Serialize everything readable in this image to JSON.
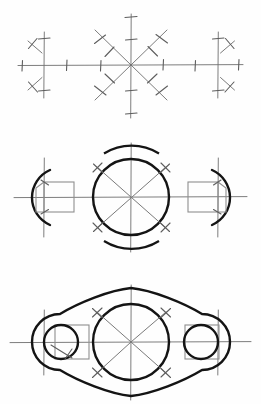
{
  "document": {
    "title": "Geometric Construction — Three Stages",
    "background_color": "#fefefe",
    "width": 261,
    "height": 404,
    "line_colors": {
      "construction": "#6e6e6e",
      "light_gray": "#8e8e8e",
      "object_outline": "#141414"
    }
  },
  "figures": [
    {
      "id": "stage-1",
      "caption": "Stage 1 — centerlines and compass step-off marks",
      "center_axis_y": 65,
      "horizontal_axis": {
        "x1": 18,
        "x2": 243,
        "y": 65
      },
      "centers": [
        {
          "name": "left-center",
          "x": 44,
          "y": 65,
          "vertical_extent": [
            32,
            98
          ]
        },
        {
          "name": "middle-center",
          "x": 131,
          "y": 65,
          "vertical_extent": [
            14,
            118
          ]
        },
        {
          "name": "right-center",
          "x": 218,
          "y": 65,
          "vertical_extent": [
            32,
            98
          ]
        }
      ],
      "star_rays": 8,
      "ray_tick_count_per_ray": 2,
      "side_diagonal_marks": 2
    },
    {
      "id": "stage-2",
      "caption": "Stage 2 — circles, arcs and squares blocked in",
      "center_axis_y": 197,
      "horizontal_axis": {
        "x1": 14,
        "x2": 247,
        "y": 197
      },
      "middle_circle": {
        "cx": 131,
        "cy": 197,
        "r": 38
      },
      "middle_arcs": {
        "radius": 52,
        "top": true,
        "bottom": true
      },
      "left_detail": {
        "cx": 44,
        "cy": 197,
        "arc_radius": 30,
        "square_size": 30,
        "opens": "left"
      },
      "right_detail": {
        "cx": 218,
        "cy": 197,
        "arc_radius": 30,
        "square_size": 30,
        "opens": "right"
      }
    },
    {
      "id": "stage-3",
      "caption": "Stage 3 — finished lens-shaped plate outline with bosses",
      "center_axis_y": 342,
      "horizontal_axis": {
        "x1": 10,
        "x2": 251,
        "y": 342
      },
      "outline_apex_top": {
        "x": 131,
        "y": 288
      },
      "outline_apex_bottom": {
        "x": 131,
        "y": 396
      },
      "end_radius": 27,
      "middle_circle": {
        "cx": 131,
        "cy": 342,
        "r": 38
      },
      "bosses": [
        {
          "name": "left-boss",
          "cx": 44,
          "cy": 342,
          "r": 17,
          "square_size": 34
        },
        {
          "name": "right-boss",
          "cx": 218,
          "cy": 342,
          "r": 17,
          "square_size": 34
        }
      ],
      "diagonal_construction_marks": 4
    }
  ]
}
